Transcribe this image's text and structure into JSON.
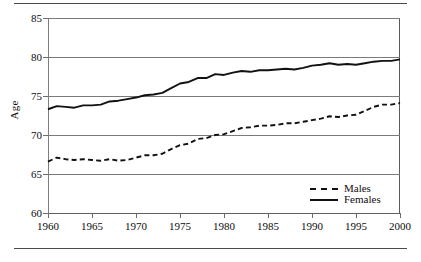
{
  "chart_data": {
    "type": "line",
    "title": "",
    "xlabel": "",
    "ylabel": "Age",
    "xlim": [
      1960,
      2000
    ],
    "ylim": [
      60,
      85
    ],
    "grid": true,
    "legend_position": "bottom-right",
    "xticks": [
      1960,
      1965,
      1970,
      1975,
      1980,
      1985,
      1990,
      1995,
      2000
    ],
    "yticks": [
      60,
      65,
      70,
      75,
      80,
      85
    ],
    "x": [
      1960,
      1961,
      1962,
      1963,
      1964,
      1965,
      1966,
      1967,
      1968,
      1969,
      1970,
      1971,
      1972,
      1973,
      1974,
      1975,
      1976,
      1977,
      1978,
      1979,
      1980,
      1981,
      1982,
      1983,
      1984,
      1985,
      1986,
      1987,
      1988,
      1989,
      1990,
      1991,
      1992,
      1993,
      1994,
      1995,
      1996,
      1997,
      1998,
      1999,
      2000
    ],
    "series": [
      {
        "name": "Males",
        "style": "dashed",
        "color": "#111111",
        "values": [
          66.6,
          67.1,
          66.9,
          66.8,
          66.9,
          66.8,
          66.7,
          66.9,
          66.7,
          66.8,
          67.1,
          67.4,
          67.4,
          67.6,
          68.2,
          68.7,
          68.9,
          69.5,
          69.6,
          70.0,
          70.1,
          70.5,
          70.9,
          71.0,
          71.2,
          71.2,
          71.3,
          71.5,
          71.5,
          71.7,
          71.9,
          72.1,
          72.4,
          72.3,
          72.5,
          72.6,
          73.1,
          73.6,
          73.9,
          73.9,
          74.1
        ]
      },
      {
        "name": "Females",
        "style": "solid",
        "color": "#111111",
        "values": [
          73.3,
          73.7,
          73.6,
          73.5,
          73.8,
          73.8,
          73.9,
          74.3,
          74.4,
          74.6,
          74.8,
          75.1,
          75.2,
          75.4,
          76.0,
          76.6,
          76.8,
          77.3,
          77.3,
          77.8,
          77.7,
          78.0,
          78.2,
          78.1,
          78.3,
          78.3,
          78.4,
          78.5,
          78.4,
          78.6,
          78.9,
          79.0,
          79.2,
          79.0,
          79.1,
          79.0,
          79.2,
          79.4,
          79.5,
          79.5,
          79.7
        ]
      }
    ]
  },
  "legend": {
    "items": [
      {
        "label": "Males"
      },
      {
        "label": "Females"
      }
    ]
  },
  "axis": {
    "y_title": "Age"
  }
}
